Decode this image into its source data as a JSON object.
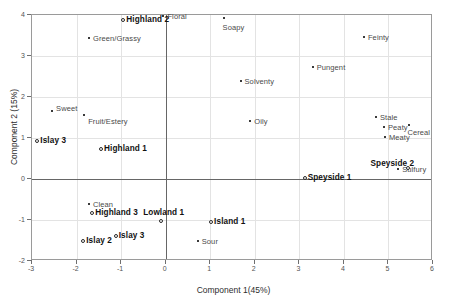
{
  "chart_data": {
    "type": "scatter",
    "title": "",
    "xlabel": "Component 1(45%)",
    "ylabel": "Component 2 (15%)",
    "xlim": [
      -3,
      6
    ],
    "ylim": [
      -2,
      4
    ],
    "xticks": [
      "-3",
      "-2",
      "-1",
      "0",
      "1",
      "2",
      "3",
      "4",
      "5",
      "6"
    ],
    "yticks": [
      "-2",
      "-1",
      "0",
      "1",
      "2",
      "3",
      "4"
    ],
    "grid": true,
    "legend": "none",
    "series": [
      {
        "name": "Attributes",
        "marker": "small-filled-square",
        "points": [
          {
            "label": "Floral",
            "x": -0.05,
            "y": 3.97
          },
          {
            "label": "Soapy",
            "x": 1.3,
            "y": 3.92
          },
          {
            "label": "Green/Grassy",
            "x": -1.72,
            "y": 3.45
          },
          {
            "label": "Feinty",
            "x": 4.45,
            "y": 3.47
          },
          {
            "label": "Pungent",
            "x": 3.3,
            "y": 2.73
          },
          {
            "label": "Solventy",
            "x": 1.68,
            "y": 2.4
          },
          {
            "label": "Sweet",
            "x": -2.55,
            "y": 1.67
          },
          {
            "label": "Fruit/Estery",
            "x": -1.83,
            "y": 1.55
          },
          {
            "label": "Oily",
            "x": 1.9,
            "y": 1.42
          },
          {
            "label": "Stale",
            "x": 4.72,
            "y": 1.52
          },
          {
            "label": "Peaty",
            "x": 4.9,
            "y": 1.28
          },
          {
            "label": "Cereal",
            "x": 5.47,
            "y": 1.32
          },
          {
            "label": "Meaty",
            "x": 4.92,
            "y": 1.02
          },
          {
            "label": "Sulfury",
            "x": 5.22,
            "y": 0.25
          },
          {
            "label": "Clean",
            "x": -1.72,
            "y": -0.62
          },
          {
            "label": "Sour",
            "x": 0.72,
            "y": -1.5
          }
        ]
      },
      {
        "name": "Whiskies",
        "marker": "open-circle",
        "points": [
          {
            "label": "Highland 2",
            "x": -0.95,
            "y": 3.87
          },
          {
            "label": "Islay 3",
            "x": -2.88,
            "y": 0.92
          },
          {
            "label": "Highland 1",
            "x": -1.45,
            "y": 0.73
          },
          {
            "label": "Speyside 2",
            "x": 5.45,
            "y": 0.27
          },
          {
            "label": "Speyside 1",
            "x": 3.12,
            "y": 0.02
          },
          {
            "label": "Highland 3",
            "x": -1.65,
            "y": -0.82
          },
          {
            "label": "Lowland 1",
            "x": -0.1,
            "y": -1.02
          },
          {
            "label": "Island 1",
            "x": 1.02,
            "y": -1.05
          },
          {
            "label": "Islay 3",
            "x": -1.12,
            "y": -1.38
          },
          {
            "label": "Islay 2",
            "x": -1.85,
            "y": -1.52
          }
        ]
      }
    ]
  }
}
